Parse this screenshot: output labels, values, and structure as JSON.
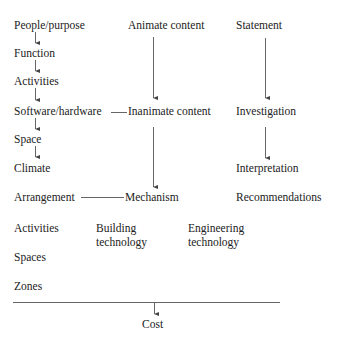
{
  "diagram": {
    "column_left": {
      "items": [
        "People/purpose",
        "Function",
        "Activities",
        "Software/hardware",
        "Space",
        "Climate",
        "Arrangement",
        "Activities",
        "Spaces",
        "Zones"
      ]
    },
    "column_middle": {
      "items": [
        "Animate content",
        "Inanimate content",
        "Mechanism"
      ],
      "building_technology": [
        "Building",
        "technology"
      ]
    },
    "column_right": {
      "items": [
        "Statement",
        "Investigation",
        "Interpretation",
        "Recommendations"
      ],
      "engineering_technology": [
        "Engineering",
        "technology"
      ]
    },
    "bottom": {
      "label": "Cost"
    },
    "line_color": "#666666",
    "text_color": "#222222"
  }
}
